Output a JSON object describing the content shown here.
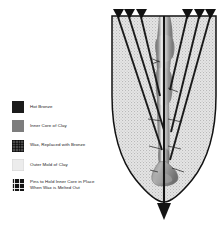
{
  "diagram": {
    "legend": {
      "items": [
        {
          "label": "Hot Bronze",
          "color": "#1b1b1b",
          "swatch": "solid-dark"
        },
        {
          "label": "Inner Core of Clay",
          "color": "#7d7d7d",
          "swatch": "mid-gray"
        },
        {
          "label": "Wax, Replaced with Bronze",
          "color": "#4a4a4a",
          "swatch": "wax-hatch"
        },
        {
          "label": "Outer Mold of Clay",
          "color": "#ececec",
          "swatch": "light"
        },
        {
          "label": "Pins to Hold Inner Core in Place\nWhen Wax is Melted Out",
          "color": "#141414",
          "swatch": "pins-grid"
        }
      ]
    },
    "figure": {
      "outer_mold_fill": "#e3e3e3",
      "outline_color": "#121212",
      "pin_color": "#1a1a1a",
      "sprue_arrow_color": "#141414",
      "pin_count": 6,
      "pin_heads_left": 3,
      "pin_heads_right": 3,
      "core_label": "leg sculpture core",
      "flow_direction": "down"
    }
  }
}
